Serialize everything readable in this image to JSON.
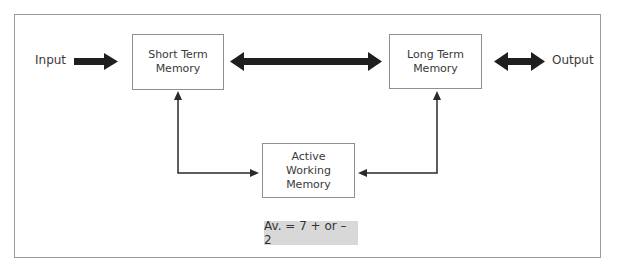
{
  "diagram": {
    "nodes": {
      "input": {
        "label": "Input"
      },
      "output": {
        "label": "Output"
      },
      "short_term": {
        "line1": "Short Term",
        "line2": "Memory"
      },
      "long_term": {
        "line1": "Long Term",
        "line2": "Memory"
      },
      "active_working": {
        "line1": "Active",
        "line2": "Working",
        "line3": "Memory"
      }
    },
    "note": "Av. = 7 + or – 2",
    "edges": [
      {
        "from": "Input",
        "to": "Short Term Memory",
        "style": "thick-arrow"
      },
      {
        "from": "Short Term Memory",
        "to": "Long Term Memory",
        "style": "thick-double-arrow"
      },
      {
        "from": "Long Term Memory",
        "to": "Output",
        "style": "thick-double-arrow"
      },
      {
        "from": "Active Working Memory",
        "to": "Short Term Memory",
        "style": "thin-double-arrow"
      },
      {
        "from": "Active Working Memory",
        "to": "Long Term Memory",
        "style": "thin-double-arrow"
      }
    ],
    "colors": {
      "frame": "#9a9a9a",
      "arrow": "#1f1f1f",
      "note_bg": "#d8d8d8"
    }
  }
}
